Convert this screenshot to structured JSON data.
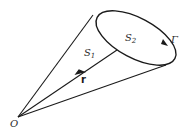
{
  "diagram": {
    "labels": {
      "origin": "O",
      "surface1": "S",
      "surface1_sub": "1",
      "surface2": "S",
      "surface2_sub": "2",
      "curve": "Γ",
      "vector": "r"
    },
    "colors": {
      "stroke": "#1a1a1a",
      "background": "#ffffff"
    }
  }
}
